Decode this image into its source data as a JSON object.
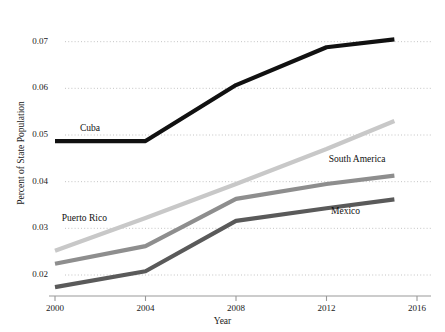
{
  "chart_data": {
    "type": "line",
    "title": "",
    "xlabel": "Year",
    "ylabel": "Percent of State Population",
    "xlim": [
      2000,
      2016
    ],
    "ylim": [
      0.0155,
      0.0725
    ],
    "grid": true,
    "grid_style": "dotted-horizontal",
    "legend_position": "inline-labels",
    "xticks": [
      2000,
      2004,
      2008,
      2012,
      2016
    ],
    "xtick_labels": [
      "2000",
      "2004",
      "2008",
      "2012",
      "2016"
    ],
    "yticks": [
      0.02,
      0.03,
      0.04,
      0.05,
      0.06,
      0.07
    ],
    "ytick_labels": [
      "0.02",
      "0.03",
      "0.04",
      "0.05",
      "0.06",
      "0.07"
    ],
    "x": [
      2000,
      2004,
      2008,
      2012,
      2015
    ],
    "series": [
      {
        "name": "Cuba",
        "color": "#111111",
        "width": 4.2,
        "values": [
          0.0487,
          0.0487,
          0.0607,
          0.0688,
          0.0705
        ],
        "label_x": 2001.1,
        "label_y": 0.0513
      },
      {
        "name": "Puerto Rico",
        "color": "#c8c8c8",
        "width": 4.2,
        "values": [
          0.0252,
          0.0322,
          0.0395,
          0.047,
          0.053
        ],
        "label_x": 2000.3,
        "label_y": 0.032
      },
      {
        "name": "South America",
        "color": "#8e8e8e",
        "width": 4.2,
        "values": [
          0.0224,
          0.0262,
          0.0363,
          0.0395,
          0.0413
        ],
        "label_x": 2012.1,
        "label_y": 0.0447
      },
      {
        "name": "Mexico",
        "color": "#5a5a5a",
        "width": 4.2,
        "values": [
          0.0174,
          0.0208,
          0.0316,
          0.0343,
          0.0362
        ],
        "label_x": 2012.2,
        "label_y": 0.0336
      }
    ],
    "axis_color": "#999999",
    "grid_color": "#bdbdbd",
    "background": "#ffffff"
  }
}
